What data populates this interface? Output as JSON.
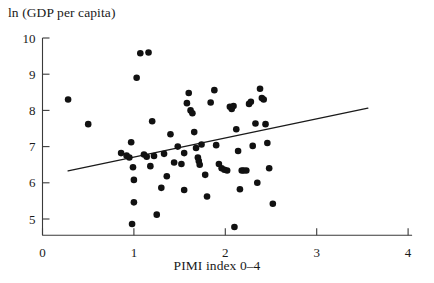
{
  "chart_data": {
    "type": "scatter",
    "title": "",
    "xlabel": "PIMI index 0–4",
    "ylabel": "ln (GDP per capita)",
    "xlim": [
      0,
      4
    ],
    "ylim": [
      4.55,
      10
    ],
    "xticks": [
      0,
      1,
      2,
      3,
      4
    ],
    "xtick_labels": [
      "0",
      "1",
      "2",
      "3",
      "4"
    ],
    "yticks": [
      5,
      6,
      7,
      8,
      9,
      10
    ],
    "ytick_labels": [
      "5",
      "6",
      "7",
      "8",
      "9",
      "10"
    ],
    "grid": false,
    "legend": "none",
    "marker": "filled-circle",
    "marker_color": "#111111",
    "marker_size_px": 4.6,
    "axis_color": "#3a3a3a",
    "points": [
      {
        "x": 0.28,
        "y": 8.3
      },
      {
        "x": 0.5,
        "y": 7.62
      },
      {
        "x": 0.86,
        "y": 6.82
      },
      {
        "x": 0.92,
        "y": 6.75
      },
      {
        "x": 0.95,
        "y": 6.7
      },
      {
        "x": 0.97,
        "y": 7.12
      },
      {
        "x": 0.99,
        "y": 6.43
      },
      {
        "x": 1.0,
        "y": 6.08
      },
      {
        "x": 1.0,
        "y": 5.46
      },
      {
        "x": 0.98,
        "y": 4.86
      },
      {
        "x": 1.03,
        "y": 8.9
      },
      {
        "x": 1.07,
        "y": 9.58
      },
      {
        "x": 1.11,
        "y": 6.78
      },
      {
        "x": 1.14,
        "y": 6.72
      },
      {
        "x": 1.16,
        "y": 9.6
      },
      {
        "x": 1.2,
        "y": 7.7
      },
      {
        "x": 1.22,
        "y": 6.74
      },
      {
        "x": 1.25,
        "y": 5.12
      },
      {
        "x": 1.33,
        "y": 6.8
      },
      {
        "x": 1.4,
        "y": 7.34
      },
      {
        "x": 1.44,
        "y": 6.56
      },
      {
        "x": 1.48,
        "y": 7.0
      },
      {
        "x": 1.52,
        "y": 6.52
      },
      {
        "x": 1.55,
        "y": 5.8
      },
      {
        "x": 1.58,
        "y": 8.2
      },
      {
        "x": 1.6,
        "y": 8.48
      },
      {
        "x": 1.62,
        "y": 8.0
      },
      {
        "x": 1.64,
        "y": 7.92
      },
      {
        "x": 1.66,
        "y": 7.4
      },
      {
        "x": 1.68,
        "y": 6.96
      },
      {
        "x": 1.7,
        "y": 6.7
      },
      {
        "x": 1.71,
        "y": 6.6
      },
      {
        "x": 1.72,
        "y": 6.5
      },
      {
        "x": 1.74,
        "y": 7.06
      },
      {
        "x": 1.78,
        "y": 6.22
      },
      {
        "x": 1.8,
        "y": 5.62
      },
      {
        "x": 1.84,
        "y": 8.22
      },
      {
        "x": 1.88,
        "y": 8.56
      },
      {
        "x": 1.9,
        "y": 7.04
      },
      {
        "x": 1.93,
        "y": 6.52
      },
      {
        "x": 1.96,
        "y": 6.4
      },
      {
        "x": 1.99,
        "y": 6.36
      },
      {
        "x": 2.02,
        "y": 6.34
      },
      {
        "x": 2.05,
        "y": 8.1
      },
      {
        "x": 2.07,
        "y": 8.04
      },
      {
        "x": 2.09,
        "y": 8.12
      },
      {
        "x": 2.12,
        "y": 7.48
      },
      {
        "x": 2.14,
        "y": 6.88
      },
      {
        "x": 2.16,
        "y": 5.82
      },
      {
        "x": 2.18,
        "y": 6.34
      },
      {
        "x": 2.2,
        "y": 6.34
      },
      {
        "x": 2.23,
        "y": 6.34
      },
      {
        "x": 2.26,
        "y": 8.18
      },
      {
        "x": 2.28,
        "y": 8.24
      },
      {
        "x": 2.3,
        "y": 7.02
      },
      {
        "x": 2.33,
        "y": 7.64
      },
      {
        "x": 2.35,
        "y": 6.0
      },
      {
        "x": 2.38,
        "y": 8.6
      },
      {
        "x": 2.4,
        "y": 8.34
      },
      {
        "x": 2.42,
        "y": 8.3
      },
      {
        "x": 2.44,
        "y": 7.62
      },
      {
        "x": 2.46,
        "y": 7.1
      },
      {
        "x": 2.48,
        "y": 6.4
      },
      {
        "x": 2.52,
        "y": 5.42
      },
      {
        "x": 2.1,
        "y": 4.78
      },
      {
        "x": 1.55,
        "y": 6.82
      },
      {
        "x": 1.36,
        "y": 6.18
      },
      {
        "x": 1.18,
        "y": 6.46
      },
      {
        "x": 1.3,
        "y": 5.86
      }
    ],
    "trendline": {
      "label": "",
      "x_start": 0.28,
      "y_start": 6.33,
      "x_end": 3.56,
      "y_end": 8.06,
      "color": "#1a1a1a"
    }
  }
}
